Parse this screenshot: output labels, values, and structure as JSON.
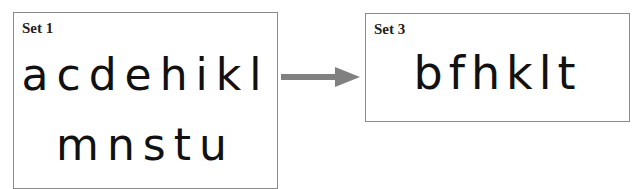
{
  "set1": {
    "label": "Set 1",
    "row1": "acdehikl",
    "row2": "mnstu"
  },
  "arrow": {
    "color": "#808080",
    "direction": "right"
  },
  "set3": {
    "label": "Set 3",
    "row1": "bfhklt"
  }
}
